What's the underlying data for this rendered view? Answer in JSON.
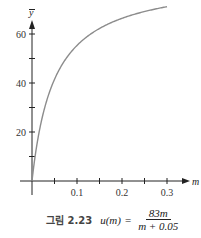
{
  "chart_data": {
    "type": "line",
    "title": "",
    "xlabel": "m",
    "ylabel": "y",
    "xlim": [
      0,
      0.34
    ],
    "ylim": [
      0,
      80
    ],
    "x_ticks": [
      0.05,
      0.1,
      0.15,
      0.2,
      0.25,
      0.3
    ],
    "x_tick_labels": [
      {
        "value": 0.1,
        "label": "0.1"
      },
      {
        "value": 0.2,
        "label": "0.2"
      },
      {
        "value": 0.3,
        "label": "0.3"
      }
    ],
    "y_ticks": [
      10,
      20,
      30,
      40,
      50,
      60,
      70
    ],
    "y_tick_labels": [
      {
        "value": 20,
        "label": "20"
      },
      {
        "value": 40,
        "label": "40"
      },
      {
        "value": 60,
        "label": "60"
      }
    ],
    "grid": false,
    "series": [
      {
        "name": "u(m) = 83m/(m+0.05)",
        "function": {
          "a": 83,
          "b": 0.05
        },
        "x_range": [
          0,
          0.3
        ],
        "color": "#8c8c8c"
      }
    ]
  },
  "caption": {
    "prefix": "그림 2.23",
    "lhs": "u(m)",
    "equals": "=",
    "numerator": "83m",
    "denominator": "m + 0.05"
  }
}
